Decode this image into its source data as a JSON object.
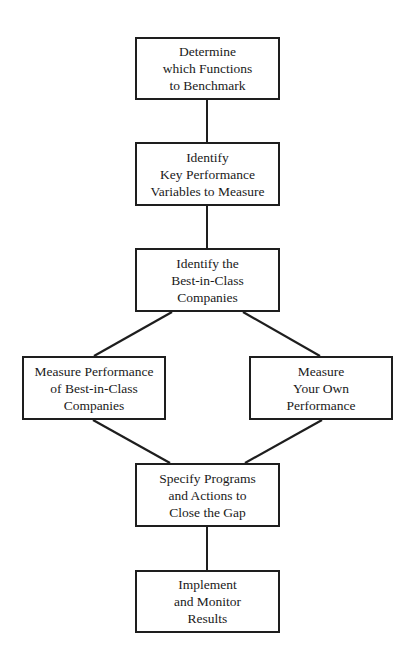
{
  "diagram": {
    "type": "flowchart",
    "nodes": [
      {
        "id": "n1",
        "lines": [
          "Determine",
          "which Functions",
          "to Benchmark"
        ],
        "label": "Determine which Functions to Benchmark",
        "box": {
          "x": 135,
          "y": 37,
          "w": 145,
          "h": 63
        }
      },
      {
        "id": "n2",
        "lines": [
          "Identify",
          "Key Performance",
          "Variables to Measure"
        ],
        "label": "Identify Key Performance Variables to Measure",
        "box": {
          "x": 135,
          "y": 142,
          "w": 145,
          "h": 64
        }
      },
      {
        "id": "n3",
        "lines": [
          "Identify the",
          "Best-in-Class",
          "Companies"
        ],
        "label": "Identify the Best-in-Class Companies",
        "box": {
          "x": 135,
          "y": 248,
          "w": 145,
          "h": 64
        }
      },
      {
        "id": "n4",
        "lines": [
          "Measure Performance",
          "of Best-in-Class",
          "Companies"
        ],
        "label": "Measure Performance of Best-in-Class Companies",
        "box": {
          "x": 22,
          "y": 356,
          "w": 144,
          "h": 64
        }
      },
      {
        "id": "n5",
        "lines": [
          "Measure",
          "Your Own",
          "Performance"
        ],
        "label": "Measure Your Own Performance",
        "box": {
          "x": 249,
          "y": 356,
          "w": 144,
          "h": 64
        }
      },
      {
        "id": "n6",
        "lines": [
          "Specify Programs",
          "and Actions to",
          "Close the Gap"
        ],
        "label": "Specify Programs and Actions to Close the Gap",
        "box": {
          "x": 135,
          "y": 463,
          "w": 145,
          "h": 64
        }
      },
      {
        "id": "n7",
        "lines": [
          "Implement",
          "and Monitor",
          "Results"
        ],
        "label": "Implement and Monitor Results",
        "box": {
          "x": 135,
          "y": 570,
          "w": 145,
          "h": 63
        }
      }
    ],
    "edges": [
      {
        "from": "n1",
        "to": "n2",
        "x1": 207,
        "y1": 100,
        "x2": 207,
        "y2": 142
      },
      {
        "from": "n2",
        "to": "n3",
        "x1": 207,
        "y1": 206,
        "x2": 207,
        "y2": 248
      },
      {
        "from": "n3",
        "to": "n4",
        "x1": 172,
        "y1": 312,
        "x2": 94,
        "y2": 356
      },
      {
        "from": "n3",
        "to": "n5",
        "x1": 243,
        "y1": 312,
        "x2": 320,
        "y2": 356
      },
      {
        "from": "n4",
        "to": "n6",
        "x1": 93,
        "y1": 420,
        "x2": 170,
        "y2": 463
      },
      {
        "from": "n5",
        "to": "n6",
        "x1": 322,
        "y1": 420,
        "x2": 245,
        "y2": 463
      },
      {
        "from": "n6",
        "to": "n7",
        "x1": 207,
        "y1": 527,
        "x2": 207,
        "y2": 570
      }
    ],
    "colors": {
      "line": "#1e1e1e",
      "box_border": "#1e1e1e",
      "text": "#1a1a1a",
      "background": "#ffffff"
    }
  }
}
